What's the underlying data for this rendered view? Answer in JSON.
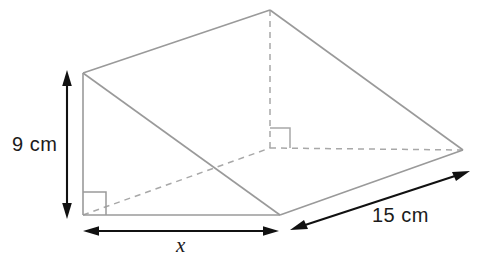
{
  "figure": {
    "shape_name": "triangular-prism",
    "colors": {
      "edge_solid": "#9a9a9a",
      "edge_hidden": "#a8a8a8",
      "dimension": "#111111",
      "background": "#ffffff"
    },
    "labels": {
      "height": "9 cm",
      "base": "x",
      "depth": "15 cm"
    },
    "dimensions": [
      {
        "name": "height",
        "text": "9 cm",
        "value": 9,
        "unit": "cm",
        "orientation": "vertical",
        "side": "left"
      },
      {
        "name": "base",
        "text": "x",
        "value": null,
        "unit": "",
        "orientation": "horizontal",
        "side": "bottom"
      },
      {
        "name": "depth",
        "text": "15 cm",
        "value": 15,
        "unit": "cm",
        "orientation": "diagonal",
        "side": "bottom-right"
      }
    ],
    "right_angles": [
      {
        "name": "front-bottom-left-right-angle",
        "style": "solid"
      },
      {
        "name": "interior-back-right-angle",
        "style": "dashed"
      }
    ],
    "vertices": {
      "front_top_left": "83,73",
      "front_bottom_left": "83,215",
      "front_bottom_right": "280,215",
      "back_top_apex": "270,10",
      "back_bottom_right": "463,150",
      "back_bottom_hidden": "270,148"
    }
  }
}
